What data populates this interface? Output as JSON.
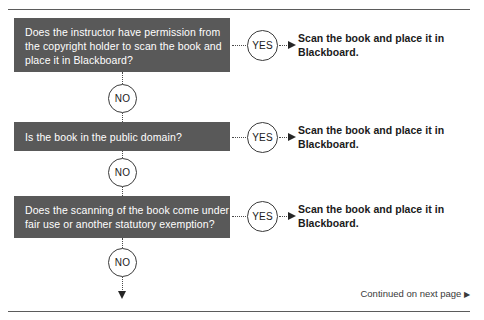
{
  "diagram": {
    "box_color": "#595959",
    "box_text_color": "#ffffff",
    "line_color": "#4a4a4a",
    "steps": [
      {
        "question_lines": [
          "Does the instructor have permission from",
          "the copyright holder to scan the book and",
          "place it in Blackboard?"
        ],
        "yes_label": "YES",
        "no_label": "NO",
        "outcome_lines": [
          "Scan the book and place it in",
          "Blackboard."
        ]
      },
      {
        "question_lines": [
          "Is the book in the public domain?"
        ],
        "yes_label": "YES",
        "no_label": "NO",
        "outcome_lines": [
          "Scan the book and place it in",
          "Blackboard."
        ]
      },
      {
        "question_lines": [
          "Does the scanning of the book come under",
          "fair use or another statutory exemption?"
        ],
        "yes_label": "YES",
        "no_label": "NO",
        "outcome_lines": [
          "Scan the book and place it in",
          "Blackboard."
        ]
      }
    ],
    "footer": {
      "text": "Continued on next page",
      "marker": "▶"
    }
  }
}
